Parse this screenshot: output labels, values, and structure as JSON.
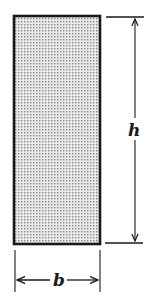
{
  "diagram": {
    "type": "rectangular-cross-section",
    "labels": {
      "height": "h",
      "width": "b"
    },
    "colors": {
      "outline": "#1a1a1a",
      "fill_dots": "#8a8a8a",
      "fill_background": "#e6e6e6"
    }
  }
}
